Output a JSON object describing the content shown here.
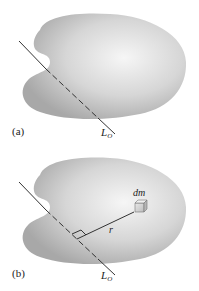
{
  "figure": {
    "panels": [
      {
        "id": "a",
        "label": "(a)",
        "axis_label": "L",
        "axis_subscript": "O"
      },
      {
        "id": "b",
        "label": "(b)",
        "axis_label": "L",
        "axis_subscript": "O",
        "mass_element_label": "dm",
        "distance_label": "r"
      }
    ],
    "colors": {
      "body_fill_dark": "#a9a9a9",
      "body_fill_light": "#f4f4f4",
      "line": "#333333"
    }
  }
}
